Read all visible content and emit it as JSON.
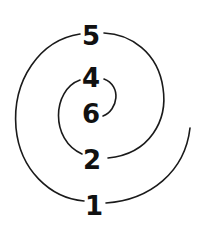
{
  "diagram": {
    "type": "numbered-spiral",
    "stroke_color": "#1a1a1a",
    "label_color": "#111111",
    "nodes": [
      {
        "id": "n5",
        "label": "5",
        "x": 91,
        "y": 36
      },
      {
        "id": "n4",
        "label": "4",
        "x": 91,
        "y": 78
      },
      {
        "id": "n6",
        "label": "6",
        "x": 91,
        "y": 114
      },
      {
        "id": "n2",
        "label": "2",
        "x": 92,
        "y": 160
      },
      {
        "id": "n1",
        "label": "1",
        "x": 94,
        "y": 206
      }
    ],
    "spiral_order": [
      "6",
      "4",
      "2",
      "5",
      "1"
    ]
  }
}
